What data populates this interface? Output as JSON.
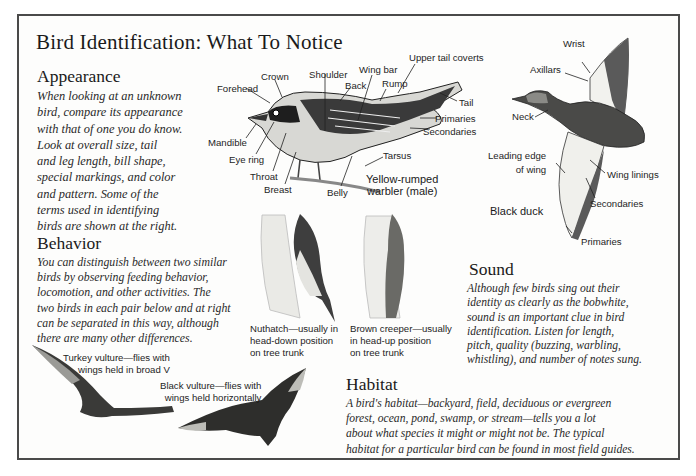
{
  "title": "Bird Identification: What To Notice",
  "sections": {
    "appearance": {
      "heading": "Appearance",
      "lines": [
        "When looking at an unknown",
        "bird, compare its appearance",
        "with that of one you do know.",
        "Look at overall size, tail",
        "and leg length, bill shape,",
        "special markings, and color",
        "and pattern. Some of the",
        "terms used in identifying",
        "birds are shown at the right."
      ]
    },
    "behavior": {
      "heading": "Behavior",
      "lines": [
        "You can distinguish between two similar",
        "birds by observing feeding behavior,",
        "locomotion, and other activities. The",
        "two birds in each pair below and at right",
        "can be separated in this way, although",
        "there are many other differences."
      ]
    },
    "sound": {
      "heading": "Sound",
      "lines": [
        "Although few birds sing out their",
        "identity as clearly as the bobwhite,",
        "sound is an important clue in bird",
        "identification. Listen for length,",
        "pitch, quality (buzzing, warbling,",
        "whistling), and number of notes sung."
      ]
    },
    "habitat": {
      "heading": "Habitat",
      "lines": [
        "A bird's habitat—backyard, field, deciduous or evergreen",
        "forest, ocean, pond, swamp, or stream—tells you a lot",
        "about what species it might or might not be. The typical",
        "habitat for a particular bird can be found in most field guides."
      ]
    }
  },
  "warbler": {
    "caption": [
      "Yellow-rumped",
      "warbler (male)"
    ],
    "labels": {
      "crown": "Crown",
      "forehead": "Forehead",
      "shoulder": "Shoulder",
      "back": "Back",
      "wing_bar": "Wing bar",
      "rump": "Rump",
      "upper_tail_coverts": "Upper tail coverts",
      "tail": "Tail",
      "primaries": "Primaries",
      "secondaries": "Secondaries",
      "mandible": "Mandible",
      "eye_ring": "Eye ring",
      "throat": "Throat",
      "breast": "Breast",
      "belly": "Belly",
      "tarsus": "Tarsus"
    }
  },
  "duck": {
    "caption": "Black duck",
    "labels": {
      "wrist": "Wrist",
      "axillars": "Axillars",
      "neck": "Neck",
      "leading_edge": [
        "Leading edge",
        "of wing"
      ],
      "wing_linings": "Wing linings",
      "secondaries": "Secondaries",
      "primaries": "Primaries"
    }
  },
  "nuthatch": {
    "caption": [
      "Nuthatch—usually in",
      "head-down position",
      "on tree trunk"
    ]
  },
  "creeper": {
    "caption": [
      "Brown creeper—usually",
      "in head-up position",
      "on tree trunk"
    ]
  },
  "turkey_vulture": {
    "caption": [
      "Turkey vulture—flies with",
      "wings held in broad V"
    ]
  },
  "black_vulture": {
    "caption": [
      "Black vulture—flies with",
      "wings held horizontally"
    ]
  },
  "colors": {
    "frame": "#4a4a4a",
    "ink": "#1a1a1a",
    "paper": "#fdfdfc"
  }
}
